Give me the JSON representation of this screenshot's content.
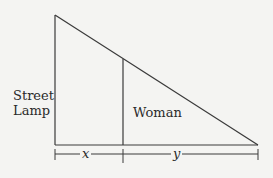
{
  "diagram": {
    "labels": {
      "street_lamp_line1": "Street",
      "street_lamp_line2": "Lamp",
      "woman": "Woman",
      "x": "x",
      "y": "y"
    },
    "colors": {
      "line": "#3a3a3a",
      "background": "#f4f4f2"
    }
  }
}
